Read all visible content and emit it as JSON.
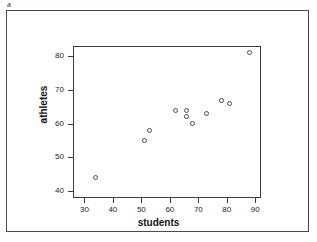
{
  "figure": {
    "panel_letter": "a",
    "background_color": "#ffffff",
    "border_color": "#4a4a4a",
    "marker_color": "#4d4d55",
    "axis_color": "#3c3c3c",
    "label_tint_color": "#7a2c8f"
  },
  "chart_data": {
    "type": "scatter",
    "title": "",
    "xlabel": "students",
    "ylabel": "athletes",
    "xlim": [
      26,
      92
    ],
    "ylim": [
      38,
      83
    ],
    "xticks": [
      30,
      40,
      50,
      60,
      70,
      80,
      90
    ],
    "yticks": [
      40,
      50,
      60,
      70,
      80
    ],
    "xtick_labels": [
      "30",
      "40",
      "50",
      "60",
      "70",
      "80",
      "90"
    ],
    "ytick_labels": [
      "40",
      "50",
      "60",
      "70",
      "80"
    ],
    "grid": false,
    "legend": null,
    "marker": "open-circle",
    "points": [
      {
        "x": 34,
        "y": 44
      },
      {
        "x": 51,
        "y": 55
      },
      {
        "x": 53,
        "y": 58
      },
      {
        "x": 62,
        "y": 64
      },
      {
        "x": 66,
        "y": 64
      },
      {
        "x": 66,
        "y": 62
      },
      {
        "x": 68,
        "y": 60
      },
      {
        "x": 73,
        "y": 63
      },
      {
        "x": 78,
        "y": 67
      },
      {
        "x": 81,
        "y": 66
      },
      {
        "x": 88,
        "y": 81
      }
    ]
  }
}
